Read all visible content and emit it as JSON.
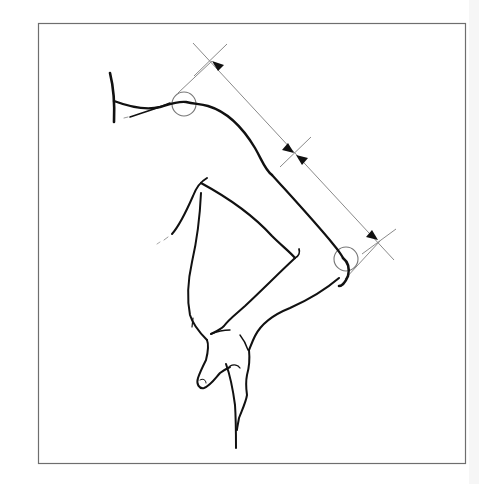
{
  "figure": {
    "colors": {
      "background": "#ffffff",
      "frame": "#6e6e6e",
      "outline": "#111111",
      "dimension_line": "#8a8a8a",
      "joint_circle": "#777777",
      "arrowhead": "#111111"
    },
    "joints": [
      {
        "name": "shoulder",
        "marker": "circle"
      },
      {
        "name": "elbow",
        "marker": "circle"
      }
    ],
    "dimensions": [
      {
        "name": "upper-arm-length",
        "from": "shoulder",
        "to": "mid-tick",
        "arrows": "both"
      },
      {
        "name": "forearm-length",
        "from": "mid-tick",
        "to": "elbow",
        "arrows": "both"
      }
    ]
  }
}
